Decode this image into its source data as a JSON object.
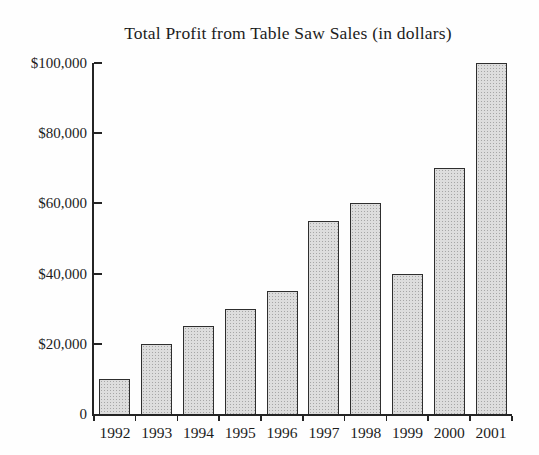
{
  "chart_data": {
    "type": "bar",
    "title": "Total Profit from Table Saw Sales (in dollars)",
    "categories": [
      "1992",
      "1993",
      "1994",
      "1995",
      "1996",
      "1997",
      "1998",
      "1999",
      "2000",
      "2001"
    ],
    "values": [
      10000,
      20000,
      25000,
      30000,
      35000,
      55000,
      60000,
      40000,
      70000,
      100000
    ],
    "xlabel": "",
    "ylabel": "",
    "ylim": [
      0,
      100000
    ],
    "y_tick_values": [
      0,
      20000,
      40000,
      60000,
      80000,
      100000
    ],
    "y_tick_labels": [
      "0",
      "$20,000",
      "$40,000",
      "$60,000",
      "$80,000",
      "$100,000"
    ],
    "grid": false,
    "legend": false,
    "colors": {
      "bar_fill": "#dddddd",
      "bar_stipple": "#a6a6a6",
      "bar_border": "#2e2e2e",
      "axis": "#242424",
      "text": "#1c1c1c",
      "background": "#fefefe"
    }
  }
}
